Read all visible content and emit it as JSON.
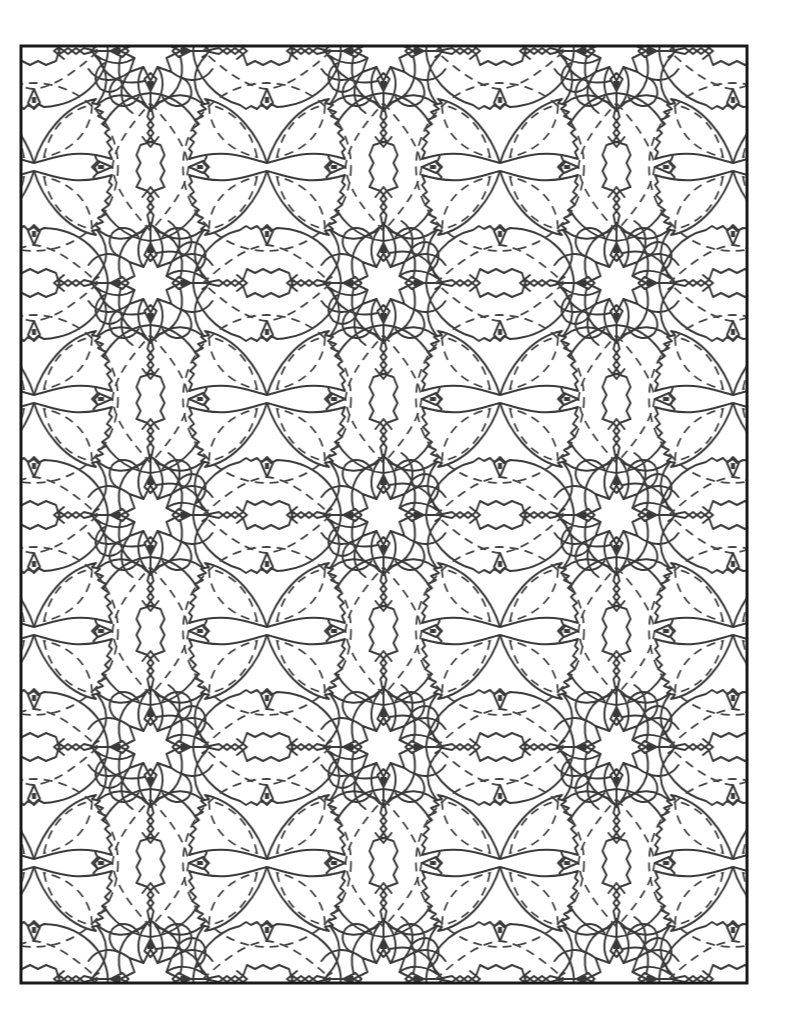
{
  "page": {
    "type": "coloring-page",
    "pattern_name": "kaleidoscope-quatrefoil-tile",
    "background_color": "#ffffff",
    "line_color": "#3a3a3a",
    "frame": {
      "x": 21,
      "y": 46,
      "width": 726,
      "height": 937,
      "stroke_width": 3,
      "color": "#1a1a1a"
    },
    "tile": {
      "width": 233,
      "height": 232,
      "origin_x": 150.5,
      "origin_y": 51
    },
    "motifs": [
      {
        "name": "quatrefoil-flower",
        "tile_position": [
          116.5,
          116
        ]
      },
      {
        "name": "vertical-eye-oval",
        "tile_position": [
          0,
          116
        ]
      },
      {
        "name": "horizontal-eye-oval",
        "tile_position": [
          116.5,
          0
        ]
      },
      {
        "name": "eight-point-star",
        "tile_position": [
          0,
          0
        ]
      }
    ]
  }
}
